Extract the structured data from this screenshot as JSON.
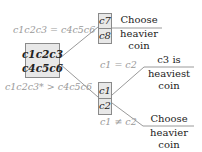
{
  "diagram": {
    "type": "decision-tree",
    "root": {
      "label_line1": "c1c2c3",
      "label_line2": "c4c5c6"
    },
    "branch_equal_top": {
      "condition": "c1c2c3 = c4c5c6",
      "node": {
        "line1": "c7",
        "line2": "c8"
      },
      "result": {
        "line1": "Choose",
        "line2": "heavier",
        "line3": "coin"
      }
    },
    "branch_greater_bottom": {
      "condition": "c1c2c3* > c4c5c6",
      "node": {
        "line1": "c1",
        "line2": "c2"
      },
      "sub_equal": {
        "condition": "c1 = c2",
        "result": {
          "line1": "c3 is",
          "line2": "heaviest",
          "line3": "coin"
        }
      },
      "sub_not_equal": {
        "condition": "c1 ≠ c2",
        "result": {
          "line1": "Choose",
          "line2": "heavier",
          "line3": "coin"
        }
      }
    },
    "colors": {
      "box_fill": "#e8e8e8",
      "box_border": "#8a8a8a",
      "condition_text": "#9a9a9a",
      "result_text": "#222222",
      "lines": "#9a9a9a"
    }
  }
}
